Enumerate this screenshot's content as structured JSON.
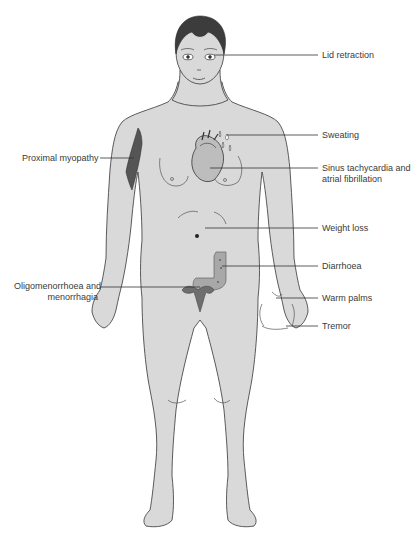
{
  "figure": {
    "colors": {
      "skin": "#d9d9d9",
      "outline": "#4a4a4a",
      "hair": "#3c3c3c",
      "muscle": "#5a5a5a",
      "organ": "#8c8c8c",
      "leader_line": "#333333",
      "text": "#3a3a3a"
    }
  },
  "labels": {
    "lid_retraction": "Lid retraction",
    "sweating": "Sweating",
    "proximal_myopathy": "Proximal myopathy",
    "sinus_tachycardia_line1": "Sinus tachycardia and",
    "sinus_tachycardia_line2": "atrial fibrillation",
    "weight_loss": "Weight loss",
    "diarrhoea": "Diarrhoea",
    "oligomenorrhoea_line1": "Oligomenorrhoea and",
    "oligomenorrhoea_line2": "menorrhagia",
    "warm_palms": "Warm palms",
    "tremor": "Tremor"
  }
}
